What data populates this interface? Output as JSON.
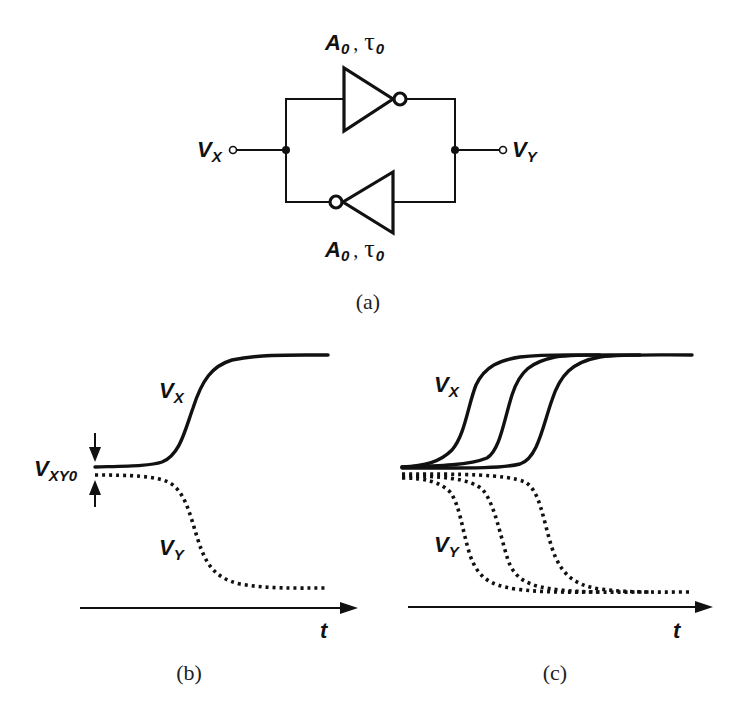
{
  "figure": {
    "panel_a": {
      "caption": "(a)",
      "top_inverter": {
        "gain": "A",
        "gain_sub": "0",
        "sep": ",",
        "tau": "τ",
        "tau_sub": "0"
      },
      "bottom_inverter": {
        "gain": "A",
        "gain_sub": "0",
        "sep": ",",
        "tau": "τ",
        "tau_sub": "0"
      },
      "left_terminal": {
        "label": "V",
        "sub": "X"
      },
      "right_terminal": {
        "label": "V",
        "sub": "Y"
      }
    },
    "panel_b": {
      "caption": "(b)",
      "vx_label": {
        "label": "V",
        "sub": "X"
      },
      "vy_label": {
        "label": "V",
        "sub": "Y"
      },
      "initial_diff_label": {
        "label": "V",
        "sub": "XY0"
      },
      "axis_label": "t"
    },
    "panel_c": {
      "caption": "(c)",
      "vx_label": {
        "label": "V",
        "sub": "X"
      },
      "vy_label": {
        "label": "V",
        "sub": "Y"
      },
      "axis_label": "t",
      "curve_count": 3
    }
  },
  "colors": {
    "ink": "#111111",
    "background": "#ffffff"
  }
}
